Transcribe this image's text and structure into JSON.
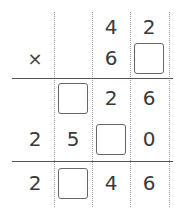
{
  "problem": {
    "operator": "×",
    "rows": [
      {
        "name": "multiplicand",
        "cells": [
          "",
          "",
          "4",
          "2"
        ]
      },
      {
        "name": "multiplier",
        "cells": [
          "",
          "",
          "6",
          "[blank]"
        ]
      },
      {
        "name": "partial-product-1",
        "cells": [
          "",
          "[blank]",
          "2",
          "6"
        ]
      },
      {
        "name": "partial-product-2",
        "cells": [
          "2",
          "5",
          "[blank]",
          "0"
        ]
      },
      {
        "name": "final-product",
        "cells": [
          "2",
          "[blank]",
          "4",
          "6"
        ]
      }
    ]
  },
  "labels": {
    "r0c2": "4",
    "r0c3": "2",
    "r1c0": "×",
    "r1c2": "6",
    "r2c2": "2",
    "r2c3": "6",
    "r3c0": "2",
    "r3c1": "5",
    "r3c3": "0",
    "r4c0": "2",
    "r4c2": "4",
    "r4c3": "6"
  }
}
